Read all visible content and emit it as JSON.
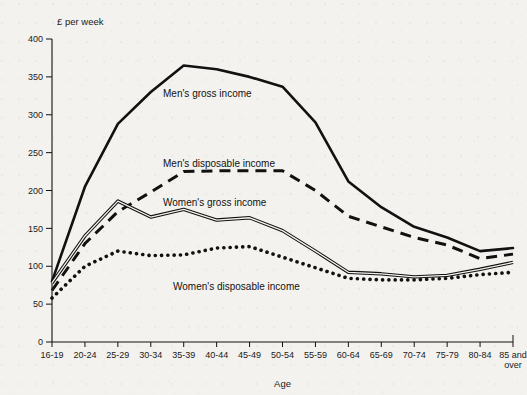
{
  "chart_data": {
    "type": "line",
    "title": "",
    "xlabel": "Age",
    "ylabel": "£ per week",
    "unit_label": "£ per week",
    "ylim": [
      0,
      400
    ],
    "ytick_step": 50,
    "yticks": [
      0,
      50,
      100,
      150,
      200,
      250,
      300,
      350,
      400
    ],
    "grid": false,
    "legend_position": "inline-annotations",
    "categories": [
      "16-19",
      "20-24",
      "25-29",
      "30-34",
      "35-39",
      "40-44",
      "45-49",
      "50-54",
      "55-59",
      "60-64",
      "65-69",
      "70-74",
      "75-79",
      "80-84",
      "85 and over"
    ],
    "category_labels_multiline": {
      "85 and over": [
        "85 and",
        "over"
      ]
    },
    "series": [
      {
        "name": "Men's gross income",
        "style": "solid",
        "values": [
          80,
          205,
          288,
          330,
          365,
          360,
          350,
          337,
          290,
          212,
          178,
          152,
          138,
          120,
          124
        ]
      },
      {
        "name": "Men's disposable income",
        "style": "dashed",
        "values": [
          68,
          130,
          172,
          198,
          225,
          226,
          226,
          226,
          200,
          166,
          152,
          138,
          128,
          110,
          116
        ]
      },
      {
        "name": "Women's gross income",
        "style": "double",
        "values": [
          78,
          140,
          186,
          165,
          175,
          161,
          164,
          147,
          120,
          92,
          90,
          86,
          88,
          96,
          105
        ]
      },
      {
        "name": "Women's disposable income",
        "style": "dotted",
        "values": [
          58,
          100,
          120,
          114,
          115,
          124,
          126,
          112,
          98,
          84,
          82,
          82,
          84,
          89,
          92
        ]
      }
    ],
    "annotations": [
      {
        "text": "Men's gross income",
        "x_px": 163,
        "y_px": 97,
        "series": "Men's gross income"
      },
      {
        "text": "Men's disposable income",
        "x_px": 163,
        "y_px": 167,
        "series": "Men's disposable income"
      },
      {
        "text": "Women's gross income",
        "x_px": 163,
        "y_px": 206,
        "series": "Women's gross income"
      },
      {
        "text": "Women's disposable income",
        "x_px": 173,
        "y_px": 290,
        "series": "Women's disposable income"
      }
    ]
  }
}
